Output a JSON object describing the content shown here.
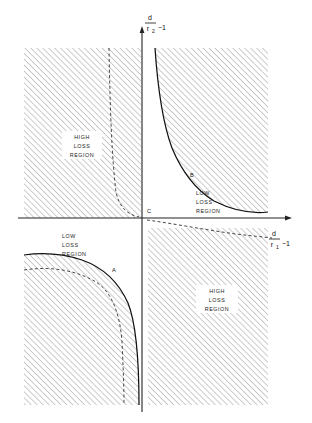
{
  "figure": {
    "type": "technical-diagram",
    "axes": {
      "x": {
        "numerator": "d",
        "denominator": "r",
        "denominator_subscript": "1",
        "suffix": "−1",
        "full_label": "d/r₁ − 1",
        "direction": "right"
      },
      "y": {
        "numerator": "d",
        "denominator": "r",
        "denominator_subscript": "2",
        "suffix": "−1",
        "full_label": "d/r₂ − 1",
        "direction": "up"
      }
    },
    "origin_label": "C",
    "point_labels": [
      {
        "name": "A",
        "quadrant": "lower-left"
      },
      {
        "name": "B",
        "quadrant": "upper-right"
      },
      {
        "name": "C",
        "quadrant": "origin"
      }
    ],
    "regions": [
      {
        "id": "q2",
        "quadrant": "upper-left",
        "line1": "HIGH",
        "line2": "LOSS",
        "line3": "REGION",
        "hatched": true
      },
      {
        "id": "q1",
        "quadrant": "upper-right",
        "line1": "LOW",
        "line2": "LOSS",
        "line3": "REGION",
        "hatched": false
      },
      {
        "id": "q3",
        "quadrant": "lower-left",
        "line1": "LOW",
        "line2": "LOSS",
        "line3": "REGION",
        "hatched": false
      },
      {
        "id": "q4",
        "quadrant": "lower-right",
        "line1": "HIGH",
        "line2": "LOSS",
        "line3": "REGION",
        "hatched": true
      }
    ],
    "colors": {
      "axis": "#222222",
      "curve": "#111111",
      "hatch": "#9a9a9a",
      "hatch_fill": "#ffffff",
      "text": "#1a1a1a",
      "background": "#ffffff"
    },
    "curves": [
      {
        "id": "hyperbola-upper-right",
        "style": "solid",
        "marker": "B"
      },
      {
        "id": "hyperbola-lower-left",
        "style": "solid",
        "marker": "A"
      },
      {
        "id": "asymptote-upper-left",
        "style": "dashed"
      },
      {
        "id": "asymptote-lower-left",
        "style": "dashed"
      },
      {
        "id": "asymptote-lower-right",
        "style": "dashed"
      }
    ]
  }
}
